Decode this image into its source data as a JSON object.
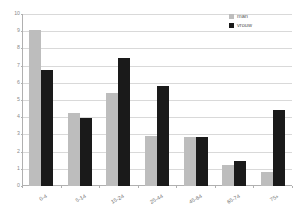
{
  "chart_data": {
    "type": "bar",
    "title": "",
    "subtitle": "",
    "xlabel": "",
    "ylabel": "",
    "categories": [
      "0-4",
      "5-14",
      "15-24",
      "25-44",
      "45-64",
      "65-74",
      "75+"
    ],
    "series": [
      {
        "name": "man",
        "color": "#bdbdbd",
        "values": [
          9.05,
          4.25,
          5.4,
          2.9,
          2.85,
          1.25,
          0.8
        ]
      },
      {
        "name": "vrouw",
        "color": "#1a1a1a",
        "values": [
          6.75,
          3.95,
          7.45,
          5.8,
          2.85,
          1.45,
          4.4
        ]
      }
    ],
    "ylim": [
      0,
      10
    ],
    "yticks": [
      0,
      1,
      2,
      3,
      4,
      5,
      6,
      7,
      8,
      9,
      10
    ],
    "ytick_labels": [
      "0",
      "1",
      "2",
      "3",
      "4",
      "5",
      "6",
      "7",
      "8",
      "9",
      "10"
    ],
    "grid": true,
    "grid_axis": "y",
    "legend": {
      "position": "top-right",
      "entries": [
        {
          "label": "man",
          "color": "#bdbdbd"
        },
        {
          "label": "vrouw",
          "color": "#1a1a1a"
        }
      ]
    },
    "axis_color": "#b0b0b0",
    "gridline_color": "#d9d9d9",
    "background": "#ffffff"
  }
}
